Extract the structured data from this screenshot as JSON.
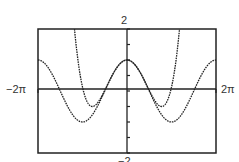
{
  "chart_data": {
    "type": "line",
    "title": "",
    "xlabel": "",
    "ylabel": "",
    "xlim": [
      -6.2832,
      6.2832
    ],
    "ylim": [
      -2,
      2
    ],
    "x_tick_labels": {
      "min": "−2π",
      "max": "2π"
    },
    "y_tick_labels": {
      "max": "2",
      "min": "−2"
    },
    "y_tick_step": 0.5,
    "grid": false,
    "legend": null,
    "series": [
      {
        "name": "y = cos x",
        "expression": "cos(x)",
        "style": "dotted",
        "color": "#222222"
      },
      {
        "name": "y = 1 − x²/2 + x⁴/24",
        "expression": "1 - x^2/2 + x^4/24",
        "style": "dotted",
        "color": "#222222"
      }
    ],
    "key_points": {
      "cos_max": [
        [
          -6.2832,
          1
        ],
        [
          0,
          1
        ],
        [
          6.2832,
          1
        ]
      ],
      "cos_min": [
        [
          -3.1416,
          -1
        ],
        [
          3.1416,
          -1
        ]
      ],
      "poly_min": [
        [
          -2.449,
          -0.5
        ],
        [
          2.449,
          -0.5
        ]
      ]
    }
  },
  "labels": {
    "ymax": "2",
    "ymin": "−2",
    "xmin": "−2π",
    "xmax": "2π"
  },
  "colors": {
    "frame": "#222222",
    "axis": "#222222",
    "curve": "#222222",
    "text": "#333333",
    "background": "#ffffff"
  }
}
